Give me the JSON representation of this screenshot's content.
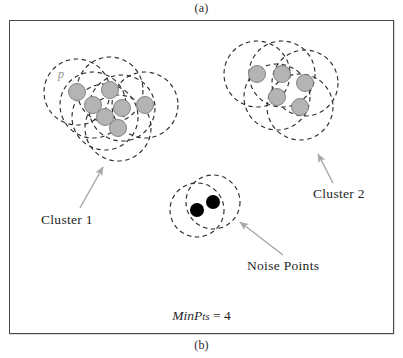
{
  "figure": {
    "caption_top": "(a)",
    "caption_bottom": "(b)",
    "parameter_label_name": "MinP",
    "parameter_label_small": "ts",
    "parameter_label_value": " = 4",
    "point_label_p": "p"
  },
  "annotations": {
    "cluster1": "Cluster 1",
    "cluster2": "Cluster 2",
    "noise": "Noise Points"
  },
  "colors": {
    "core_point_fill": "#b4b4b4",
    "core_point_stroke": "#7a7a7a",
    "noise_point_fill": "#000000",
    "dashed_circle_stroke": "#2e2e2e",
    "panel_border": "#4a4a4a",
    "arrow_stroke": "#a8a8a8",
    "background": "#ffffff"
  },
  "diagram_data": {
    "type": "scatter",
    "description": "DBSCAN density-based clustering illustration with epsilon neighborhood circles",
    "min_pts": 4,
    "point_radius": 8.5,
    "noise_point_radius": 7,
    "neighborhood_radius": 33,
    "clusters": [
      {
        "name": "Cluster 1",
        "kind": "core",
        "points": [
          {
            "x": 77,
            "y": 92
          },
          {
            "x": 110,
            "y": 90
          },
          {
            "x": 93,
            "y": 105
          },
          {
            "x": 122,
            "y": 108
          },
          {
            "x": 105,
            "y": 117
          },
          {
            "x": 145,
            "y": 105
          },
          {
            "x": 118,
            "y": 128
          }
        ]
      },
      {
        "name": "Cluster 2",
        "kind": "core",
        "points": [
          {
            "x": 257,
            "y": 74
          },
          {
            "x": 282,
            "y": 74
          },
          {
            "x": 305,
            "y": 83
          },
          {
            "x": 277,
            "y": 97
          },
          {
            "x": 300,
            "y": 107
          }
        ]
      },
      {
        "name": "Noise Points",
        "kind": "noise",
        "points": [
          {
            "x": 197,
            "y": 210
          },
          {
            "x": 213,
            "y": 202
          }
        ]
      }
    ],
    "arrows": [
      {
        "name": "cluster1-arrow",
        "x1": 80,
        "y1": 208,
        "x2": 103,
        "y2": 167
      },
      {
        "name": "cluster2-arrow",
        "x1": 333,
        "y1": 183,
        "x2": 318,
        "y2": 154
      },
      {
        "name": "noise-arrow",
        "x1": 283,
        "y1": 255,
        "x2": 240,
        "y2": 222
      }
    ]
  }
}
